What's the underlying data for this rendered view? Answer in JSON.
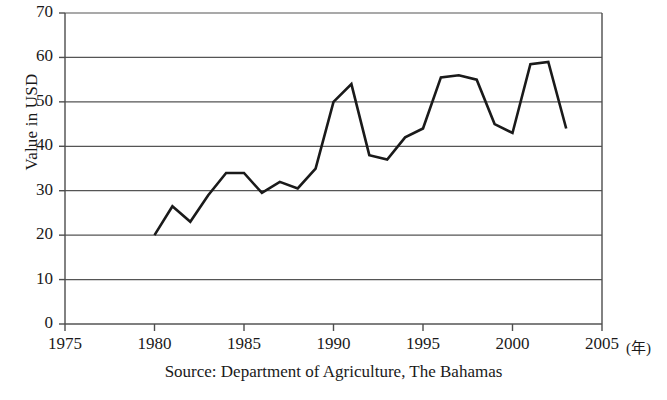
{
  "chart_data": {
    "type": "line",
    "title": "",
    "subtitle": "",
    "xlabel": "",
    "ylabel": "Value in USD",
    "x_unit_label": "(年)",
    "source_note": "Source: Department of Agriculture, The Bahamas",
    "grid": true,
    "legend": "none",
    "line_color": "#1a1a1a",
    "axis_color": "#4d4d4d",
    "grid_color": "#555555",
    "xlim": [
      1975,
      2005
    ],
    "ylim": [
      0,
      70
    ],
    "x_ticks": [
      1975,
      1980,
      1985,
      1990,
      1995,
      2000,
      2005
    ],
    "x_tick_labels": [
      "1975",
      "1980",
      "1985",
      "1990",
      "1995",
      "2000",
      "2005"
    ],
    "y_ticks": [
      0,
      10,
      20,
      30,
      40,
      50,
      60,
      70
    ],
    "y_tick_labels": [
      "0",
      "10",
      "20",
      "30",
      "40",
      "50",
      "60",
      "70"
    ],
    "x": [
      1980,
      1981,
      1982,
      1983,
      1984,
      1985,
      1986,
      1987,
      1988,
      1989,
      1990,
      1991,
      1992,
      1993,
      1994,
      1995,
      1996,
      1997,
      1998,
      1999,
      2000,
      2001,
      2002,
      2003
    ],
    "values": [
      20,
      26.5,
      23,
      29,
      34,
      34,
      29.5,
      32,
      30.5,
      35,
      50,
      54,
      38,
      37,
      42,
      44,
      55.5,
      56,
      55,
      45,
      43,
      58.5,
      59,
      44
    ]
  }
}
